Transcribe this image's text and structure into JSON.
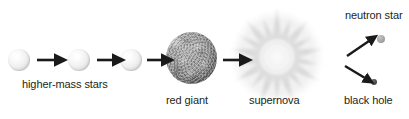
{
  "diagram": {
    "background_color": "#ffffff",
    "width": 409,
    "height": 119,
    "text_color": "#231f20",
    "arrow_color": "#1a1a1a"
  },
  "labels": {
    "higher_mass_stars": "higher-mass stars",
    "red_giant": "red giant",
    "supernova": "supernova",
    "neutron_star": "neutron star",
    "black_hole": "black hole"
  },
  "stages": [
    {
      "name": "main-sequence-star-1",
      "type": "small-star",
      "cx": 19,
      "cy": 60,
      "r": 11,
      "color": "#ededed"
    },
    {
      "name": "main-sequence-star-2",
      "type": "small-star",
      "cx": 79,
      "cy": 60,
      "r": 11,
      "color": "#ededed"
    },
    {
      "name": "main-sequence-star-3",
      "type": "small-star",
      "cx": 131,
      "cy": 60,
      "r": 11,
      "color": "#ededed"
    },
    {
      "name": "red-giant",
      "type": "giant",
      "cx": 191,
      "cy": 58,
      "r": 26,
      "color": "#8e8e8e"
    },
    {
      "name": "supernova",
      "type": "burst",
      "cx": 277,
      "cy": 57,
      "r": 48,
      "color": "#d8d8d8"
    },
    {
      "name": "neutron-star",
      "type": "remnant",
      "cx": 381,
      "cy": 39,
      "r": 4,
      "color": "#a8a8a8"
    },
    {
      "name": "black-hole",
      "type": "remnant",
      "cx": 374,
      "cy": 82,
      "r": 3,
      "color": "#4a4a4a"
    }
  ],
  "arrows": [
    {
      "name": "arrow-star1-to-star2",
      "x1": 36,
      "y1": 60,
      "x2": 62,
      "y2": 60
    },
    {
      "name": "arrow-star2-to-star3",
      "x1": 96,
      "y1": 60,
      "x2": 122,
      "y2": 60
    },
    {
      "name": "arrow-star3-to-giant",
      "x1": 146,
      "y1": 60,
      "x2": 172,
      "y2": 60
    },
    {
      "name": "arrow-giant-to-supernova",
      "x1": 222,
      "y1": 60,
      "x2": 248,
      "y2": 60
    },
    {
      "name": "arrow-supernova-to-neutron-star",
      "x1": 347,
      "y1": 55,
      "x2": 374,
      "y2": 37
    },
    {
      "name": "arrow-supernova-to-black-hole",
      "x1": 345,
      "y1": 66,
      "x2": 369,
      "y2": 80
    }
  ],
  "label_positions": {
    "higher_mass_stars": {
      "x": 22,
      "y": 79
    },
    "red_giant": {
      "x": 166,
      "y": 95
    },
    "supernova": {
      "x": 249,
      "y": 95
    },
    "neutron_star": {
      "x": 345,
      "y": 10
    },
    "black_hole": {
      "x": 344,
      "y": 95
    }
  }
}
